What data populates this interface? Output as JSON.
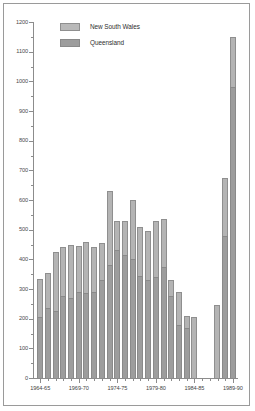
{
  "chart_data": {
    "type": "bar",
    "subtype": "stacked-bar",
    "title": "",
    "xlabel": "",
    "ylabel": "",
    "ylim": [
      0,
      1200
    ],
    "ytick_step": 100,
    "yminor_step": 50,
    "grid": false,
    "legend_position": "top-left",
    "categories": [
      "1964-65",
      "1965-66",
      "1966-67",
      "1967-68",
      "1968-69",
      "1969-70",
      "1970-71",
      "1971-72",
      "1972-73",
      "1973-74",
      "1974-75",
      "1975-76",
      "1976-77",
      "1977-78",
      "1978-79",
      "1979-80",
      "1980-81",
      "1981-82",
      "1982-83",
      "1983-84",
      "1984-85",
      "1985-86",
      "1986-87",
      "1987-88",
      "1988-89",
      "1989-90"
    ],
    "ytick_labels": [
      "0",
      "100",
      "200",
      "300",
      "400",
      "500",
      "600",
      "700",
      "800",
      "900",
      "1000",
      "1100",
      "1200"
    ],
    "xtick_labels": [
      "1964-65",
      "1969-70",
      "1974-75",
      "1979-80",
      "1984-85",
      "1989-90"
    ],
    "xtick_label_indices": [
      0,
      5,
      10,
      15,
      20,
      25
    ],
    "series": [
      {
        "name": "Queensland",
        "color": "#9d9d9d",
        "values": [
          205,
          235,
          225,
          275,
          270,
          290,
          285,
          290,
          330,
          380,
          430,
          415,
          400,
          345,
          330,
          340,
          375,
          275,
          180,
          170,
          0,
          null,
          null,
          0,
          480,
          980
        ]
      },
      {
        "name": "New South Wales",
        "color": "#b4b4b4",
        "values": [
          130,
          120,
          200,
          165,
          180,
          155,
          175,
          150,
          125,
          250,
          100,
          115,
          200,
          165,
          165,
          190,
          160,
          55,
          110,
          40,
          205,
          null,
          null,
          245,
          195,
          170
        ]
      }
    ],
    "totals": [
      335,
      355,
      425,
      440,
      450,
      445,
      460,
      440,
      455,
      630,
      530,
      530,
      600,
      510,
      495,
      530,
      535,
      330,
      290,
      210,
      205,
      null,
      null,
      245,
      675,
      1150
    ],
    "legend": [
      {
        "label": "New South Wales",
        "color": "#b4b4b4"
      },
      {
        "label": "Queensland",
        "color": "#9d9d9d"
      }
    ]
  },
  "axis": {
    "y_min": 0,
    "y_max": 1200
  }
}
